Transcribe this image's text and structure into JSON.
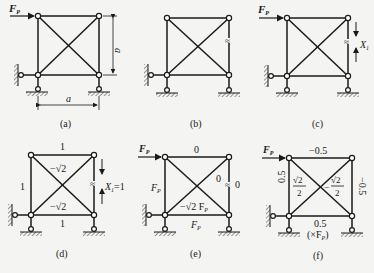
{
  "figure": {
    "colors": {
      "line": "#1a1a1a",
      "hatch": "#444444",
      "background": "#f4f4f2",
      "node_fill": "#ffffff"
    }
  },
  "panels": [
    {
      "id": "a",
      "caption": "(a)",
      "load_label": "F",
      "load_sub": "P",
      "dim_vertical": "a",
      "dim_horizontal": "a"
    },
    {
      "id": "b",
      "caption": "(b)",
      "cut_symbol": "≈"
    },
    {
      "id": "c",
      "caption": "(c)",
      "load_label": "F",
      "load_sub": "P",
      "cut_symbol": "≈",
      "redundant_label": "X",
      "redundant_sub": "1"
    },
    {
      "id": "d",
      "caption": "(d)",
      "redundant_label": "X",
      "redundant_sub": "1",
      "redundant_value": "=1",
      "forces": {
        "top": "1",
        "left": "1",
        "bottom": "1",
        "diag_upper": "−√2",
        "diag_lower": "−√2"
      }
    },
    {
      "id": "e",
      "caption": "(e)",
      "load_label": "F",
      "load_sub": "P",
      "forces": {
        "top": "0",
        "left_main": "F",
        "left_sub": "P",
        "bottom_main": "F",
        "bottom_sub": "P",
        "diag_right": "0",
        "right": "0",
        "diag_main": "−√2 F",
        "diag_sub": "P"
      }
    },
    {
      "id": "f",
      "caption": "(f)",
      "load_label": "F",
      "load_sub": "P",
      "forces": {
        "top": "−0.5",
        "left": "0.5",
        "right": "−0.5",
        "bottom": "0.5",
        "diag_left_num": "√2",
        "diag_left_den": "2",
        "diag_right_sign": "−",
        "diag_right_num": "√2",
        "diag_right_den": "2",
        "unit_note": "(×F",
        "unit_sub": "P",
        "unit_close": ")"
      }
    }
  ]
}
